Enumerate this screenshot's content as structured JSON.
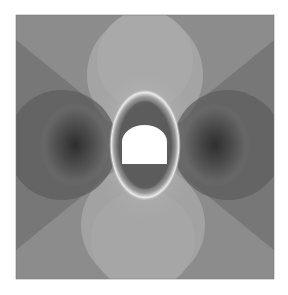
{
  "figure": {
    "plot_area": {
      "x": 16,
      "y": 15,
      "width": 258,
      "height": 264
    },
    "opening": {
      "shape": "horseshoe",
      "x": 122,
      "y": 125,
      "width": 45,
      "height": 39,
      "fill": "#ffffff"
    },
    "colors": {
      "background": "#ffffff",
      "base_gray": "#8a8a8a",
      "light_lobes": "#a3a3a3",
      "dark_lobes": "#3a3a3a",
      "ring": "#e6e6e6"
    }
  }
}
